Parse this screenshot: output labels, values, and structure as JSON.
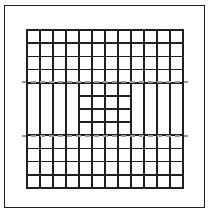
{
  "figure": {
    "type": "line-drawing",
    "canvas": {
      "width": 210,
      "height": 215,
      "background": "#ffffff"
    }
  },
  "outer_frame": {
    "label": "outer border rectangle",
    "x": 4,
    "y": 5,
    "width": 201,
    "height": 203,
    "stroke": "#231f20",
    "stroke_width": 1.5,
    "fill": "none"
  },
  "grid": {
    "label": "main 12 by 12 grid block",
    "x": 27,
    "y": 30,
    "width": 156,
    "height": 158,
    "columns": 12,
    "rows": 12,
    "cell_width": 13,
    "cell_height": 13.1667,
    "stroke": "#231f20",
    "stroke_width_major": 1.9,
    "stroke_width_minor": 1.5,
    "fill": "none"
  },
  "bands": {
    "label": "horizontal suppression band",
    "middle_band_start_row": 4,
    "middle_band_end_row": 8,
    "center_block_start_col": 4,
    "center_block_end_col": 8,
    "top_block_rows": [
      0,
      4
    ],
    "bottom_block_rows": [
      8,
      12
    ],
    "left_block_cols": [
      0,
      4
    ],
    "right_block_cols": [
      8,
      12
    ]
  },
  "dashed_lines": {
    "label": "gray dashed guide lines",
    "color": "#9a9a9a",
    "stroke_width": 1.4,
    "dash_pattern": "5,4",
    "y_positions": [
      82,
      136
    ],
    "x_start": 22,
    "x_end": 188
  },
  "legend": {
    "solid_line_label": "solid grid line",
    "dashed_line_label": "dashed guide line",
    "frame_label": "outer frame"
  },
  "chart_data": {
    "type": "table",
    "xlabel": "",
    "ylabel": "",
    "grid": true,
    "legend_position": "none",
    "categories": [
      "col1",
      "col2",
      "col3",
      "col4",
      "col5",
      "col6",
      "col7",
      "col8",
      "col9",
      "col10",
      "col11",
      "col12"
    ],
    "row_labels": [
      "row1",
      "row2",
      "row3",
      "row4",
      "row5",
      "row6",
      "row7",
      "row8",
      "row9",
      "row10",
      "row11",
      "row12"
    ]
  }
}
